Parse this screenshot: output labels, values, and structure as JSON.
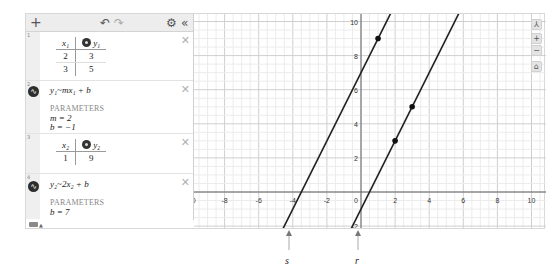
{
  "toolbar": {
    "add_icon": "+",
    "undo_icon": "↶",
    "redo_icon": "↷",
    "settings_icon": "⚙",
    "collapse_icon": "«"
  },
  "expressions": [
    {
      "index": "1",
      "type": "table",
      "headers": [
        "x₁",
        "y₁"
      ],
      "rows": [
        [
          "2",
          "3"
        ],
        [
          "3",
          "5"
        ]
      ]
    },
    {
      "index": "2",
      "type": "regression",
      "latex": "y₁~mx₁ + b",
      "params_header": "PARAMETERS",
      "params": [
        "m = 2",
        "b = −1"
      ]
    },
    {
      "index": "3",
      "type": "table",
      "headers": [
        "x₂",
        "y₂"
      ],
      "rows": [
        [
          "1",
          "9"
        ]
      ]
    },
    {
      "index": "4",
      "type": "regression",
      "latex": "y₂~2x₂ + b",
      "params_header": "PARAMETERS",
      "params": [
        "b = 7"
      ]
    }
  ],
  "graph": {
    "x_ticks": [
      "-10",
      "-8",
      "-6",
      "-4",
      "-2",
      "0",
      "2",
      "4",
      "6",
      "8",
      "10"
    ],
    "y_ticks": [
      "10",
      "8",
      "6",
      "4",
      "2"
    ],
    "y_neg_tick": "-2",
    "controls": [
      "wrench",
      "zoom-in",
      "zoom-out",
      "home"
    ],
    "lines": [
      {
        "name": "line-1",
        "slope": 2,
        "intercept": -1
      },
      {
        "name": "line-2",
        "slope": 2,
        "intercept": 7
      }
    ],
    "points": [
      {
        "x": 2,
        "y": 3
      },
      {
        "x": 3,
        "y": 5
      },
      {
        "x": 1,
        "y": 9
      }
    ]
  },
  "sliders": [
    {
      "label": "s"
    },
    {
      "label": "r"
    }
  ]
}
